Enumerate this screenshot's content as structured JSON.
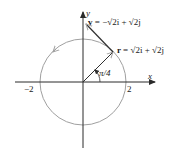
{
  "diagram": {
    "axes": {
      "x_label": "x",
      "y_label": "y",
      "tick_neg": "−2",
      "tick_pos": "2"
    },
    "circle": {
      "radius": 2,
      "direction": "counterclockwise",
      "color": "#a0a0a0"
    },
    "angle_label": "π/4",
    "position_vector": {
      "label_prefix": "r = ",
      "label_expr": "√2i + √2j",
      "components": [
        1.4142,
        1.4142
      ]
    },
    "velocity_vector": {
      "label_prefix": "v = ",
      "label_expr": "−√2i + √2j",
      "components": [
        -1.4142,
        1.4142
      ]
    },
    "colors": {
      "axis": "#2a2a2a",
      "vector": "#303030",
      "circle": "#a0a0a0"
    }
  }
}
